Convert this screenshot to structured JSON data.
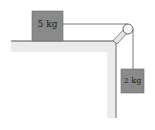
{
  "diagram": {
    "type": "physics-pulley-system",
    "blocks": [
      {
        "id": "block-on-table",
        "label": "5 kg",
        "color": "#8a8a8a"
      },
      {
        "id": "hanging-block",
        "label": "2 kg",
        "color": "#8a8a8a"
      }
    ],
    "colors": {
      "table_surface": "#ebebeb",
      "table_edge": "#555555",
      "string": "#555555",
      "pulley_fill": "#f4f4f4"
    }
  }
}
